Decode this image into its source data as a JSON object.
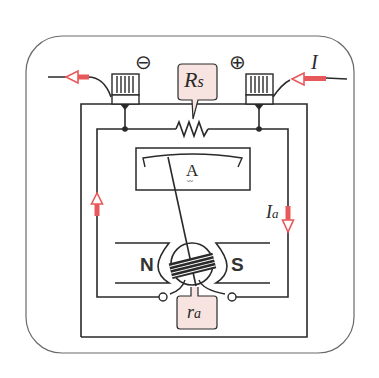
{
  "diagram": {
    "colors": {
      "line": "#2a2a2a",
      "frame": "#6a6a6a",
      "arrow": "#e8585a",
      "label_box": "#f7e4e0",
      "background": "#ffffff"
    },
    "terminals": {
      "negative": {
        "symbol": "⊖"
      },
      "positive": {
        "symbol": "⊕"
      }
    },
    "labels": {
      "shunt": {
        "main": "R",
        "sub": "s"
      },
      "current_total": {
        "main": "I"
      },
      "current_armature": {
        "main": "I",
        "sub": "a"
      },
      "armature_resistance": {
        "main": "r",
        "sub": "a"
      },
      "meter_unit": "A",
      "meter_unit_sub": "〰",
      "magnet_north": "N",
      "magnet_south": "S"
    }
  }
}
